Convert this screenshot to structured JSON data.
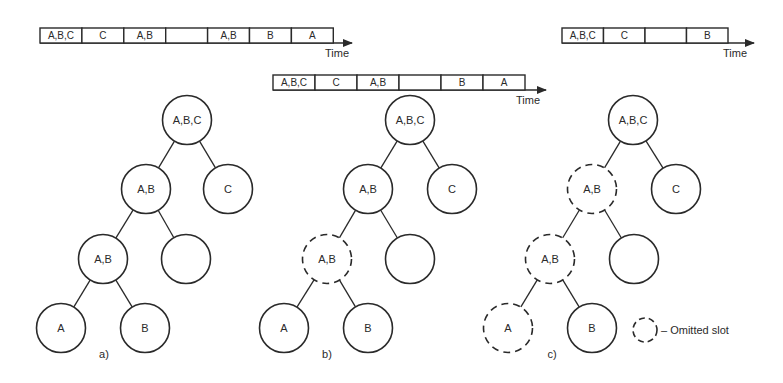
{
  "figure": {
    "time_label": "Time",
    "timelines": [
      {
        "id": "a",
        "x": 40,
        "y": 28,
        "cell_w": 41.9,
        "cell_h": 15,
        "arrow_end": 352,
        "time_label_pos": [
          325,
          57
        ],
        "cells": [
          "A,B,C",
          "C",
          "A,B",
          "",
          "A,B",
          "B",
          "A"
        ]
      },
      {
        "id": "b",
        "x": 273,
        "y": 75,
        "cell_w": 42,
        "cell_h": 15,
        "arrow_end": 546,
        "time_label_pos": [
          516,
          104
        ],
        "cells": [
          "A,B,C",
          "C",
          "A,B",
          "",
          "B",
          "A"
        ]
      },
      {
        "id": "c",
        "x": 562,
        "y": 28,
        "cell_w": 41.5,
        "cell_h": 15,
        "arrow_end": 754,
        "time_label_pos": [
          723,
          57
        ],
        "cells": [
          "A,B,C",
          "C",
          "",
          "B"
        ]
      }
    ],
    "trees": [
      {
        "id": "a",
        "label": "a)",
        "label_pos": [
          104,
          358
        ],
        "nodes": [
          {
            "id": "root",
            "label": "A,B,C",
            "x": 187,
            "y": 120,
            "omitted": false
          },
          {
            "id": "ab1",
            "label": "A,B",
            "x": 146,
            "y": 189,
            "omitted": false
          },
          {
            "id": "c",
            "label": "C",
            "x": 228,
            "y": 189,
            "omitted": false
          },
          {
            "id": "ab2",
            "label": "A,B",
            "x": 103,
            "y": 259,
            "omitted": false
          },
          {
            "id": "empty",
            "label": "",
            "x": 186,
            "y": 259,
            "omitted": false
          },
          {
            "id": "a",
            "label": "A",
            "x": 61,
            "y": 328,
            "omitted": false
          },
          {
            "id": "b",
            "label": "B",
            "x": 145,
            "y": 328,
            "omitted": false
          }
        ],
        "edges": [
          [
            "root",
            "ab1"
          ],
          [
            "root",
            "c"
          ],
          [
            "ab1",
            "ab2"
          ],
          [
            "ab1",
            "empty"
          ],
          [
            "ab2",
            "a"
          ],
          [
            "ab2",
            "b"
          ]
        ]
      },
      {
        "id": "b",
        "label": "b)",
        "label_pos": [
          327,
          358
        ],
        "nodes": [
          {
            "id": "root",
            "label": "A,B,C",
            "x": 410,
            "y": 120,
            "omitted": false
          },
          {
            "id": "ab1",
            "label": "A,B",
            "x": 368,
            "y": 189,
            "omitted": false
          },
          {
            "id": "c",
            "label": "C",
            "x": 452,
            "y": 189,
            "omitted": false
          },
          {
            "id": "ab2",
            "label": "A,B",
            "x": 327,
            "y": 259,
            "omitted": true
          },
          {
            "id": "empty",
            "label": "",
            "x": 410,
            "y": 259,
            "omitted": false
          },
          {
            "id": "a",
            "label": "A",
            "x": 284,
            "y": 328,
            "omitted": false
          },
          {
            "id": "b",
            "label": "B",
            "x": 368,
            "y": 328,
            "omitted": false
          }
        ],
        "edges": [
          [
            "root",
            "ab1"
          ],
          [
            "root",
            "c"
          ],
          [
            "ab1",
            "ab2"
          ],
          [
            "ab1",
            "empty"
          ],
          [
            "ab2",
            "a"
          ],
          [
            "ab2",
            "b"
          ]
        ]
      },
      {
        "id": "c",
        "label": "c)",
        "label_pos": [
          552,
          358
        ],
        "nodes": [
          {
            "id": "root",
            "label": "A,B,C",
            "x": 633,
            "y": 120,
            "omitted": false
          },
          {
            "id": "ab1",
            "label": "A,B",
            "x": 592,
            "y": 189,
            "omitted": true
          },
          {
            "id": "c",
            "label": "C",
            "x": 676,
            "y": 189,
            "omitted": false
          },
          {
            "id": "ab2",
            "label": "A,B",
            "x": 550,
            "y": 259,
            "omitted": true
          },
          {
            "id": "empty",
            "label": "",
            "x": 634,
            "y": 259,
            "omitted": false
          },
          {
            "id": "a",
            "label": "A",
            "x": 508,
            "y": 328,
            "omitted": true
          },
          {
            "id": "b",
            "label": "B",
            "x": 592,
            "y": 328,
            "omitted": false
          }
        ],
        "edges": [
          [
            "root",
            "ab1"
          ],
          [
            "root",
            "c"
          ],
          [
            "ab1",
            "ab2"
          ],
          [
            "ab1",
            "empty"
          ],
          [
            "ab2",
            "a"
          ],
          [
            "ab2",
            "b"
          ]
        ]
      }
    ],
    "node_radius": 24.5,
    "legend": {
      "text": "– Omitted slot",
      "icon_pos": [
        645,
        330
      ],
      "icon_radius": 12,
      "text_pos": [
        661,
        334
      ]
    },
    "colors": {
      "stroke": "#2a2a2a",
      "background": "#ffffff"
    }
  }
}
